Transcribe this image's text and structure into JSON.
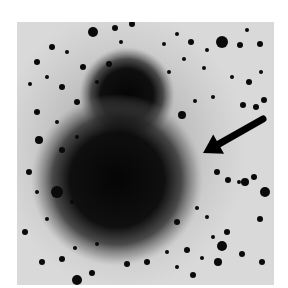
{
  "image": {
    "description": "Negative astronomical photograph of a galaxy with an upper and lower lobe against a star field, with an arrow pointing to a feature at the right edge of the lower lobe",
    "background_color": "#d9d9d9",
    "ink_color": "#0a0a0a"
  },
  "galaxy": {
    "upper_lobe": {
      "cx": 110,
      "cy": 73,
      "r": 48
    },
    "lower_lobe": {
      "cx": 100,
      "cy": 158,
      "r": 86
    }
  },
  "arrow": {
    "tail": [
      246,
      97
    ],
    "head": [
      186,
      131
    ]
  },
  "stars": [
    [
      76,
      10,
      5
    ],
    [
      98,
      6,
      3
    ],
    [
      115,
      2,
      3
    ],
    [
      205,
      20,
      6
    ],
    [
      223,
      23,
      3
    ],
    [
      230,
      8,
      2
    ],
    [
      243,
      22,
      3
    ],
    [
      20,
      40,
      3
    ],
    [
      35,
      25,
      3
    ],
    [
      50,
      30,
      2
    ],
    [
      66,
      45,
      3
    ],
    [
      92,
      42,
      3
    ],
    [
      104,
      20,
      2
    ],
    [
      147,
      22,
      2
    ],
    [
      160,
      12,
      2
    ],
    [
      174,
      20,
      3
    ],
    [
      190,
      28,
      2
    ],
    [
      13,
      62,
      2
    ],
    [
      30,
      55,
      2
    ],
    [
      45,
      65,
      3
    ],
    [
      60,
      80,
      3
    ],
    [
      80,
      60,
      2
    ],
    [
      152,
      50,
      2
    ],
    [
      167,
      37,
      2
    ],
    [
      187,
      46,
      2
    ],
    [
      215,
      55,
      2
    ],
    [
      232,
      60,
      3
    ],
    [
      244,
      50,
      2
    ],
    [
      20,
      90,
      3
    ],
    [
      40,
      100,
      2
    ],
    [
      22,
      118,
      4
    ],
    [
      45,
      128,
      3
    ],
    [
      60,
      115,
      2
    ],
    [
      165,
      93,
      4
    ],
    [
      178,
      79,
      2
    ],
    [
      196,
      75,
      2
    ],
    [
      226,
      83,
      3
    ],
    [
      239,
      85,
      3
    ],
    [
      247,
      78,
      3
    ],
    [
      12,
      150,
      3
    ],
    [
      20,
      170,
      2
    ],
    [
      40,
      170,
      6
    ],
    [
      55,
      180,
      2
    ],
    [
      30,
      197,
      2
    ],
    [
      8,
      210,
      3
    ],
    [
      200,
      150,
      3
    ],
    [
      211,
      158,
      3
    ],
    [
      228,
      160,
      4
    ],
    [
      237,
      155,
      3
    ],
    [
      222,
      160,
      2
    ],
    [
      248,
      170,
      5
    ],
    [
      243,
      197,
      3
    ],
    [
      210,
      210,
      3
    ],
    [
      196,
      215,
      2
    ],
    [
      205,
      224,
      5
    ],
    [
      201,
      240,
      4
    ],
    [
      25,
      240,
      3
    ],
    [
      45,
      237,
      3
    ],
    [
      60,
      258,
      5
    ],
    [
      75,
      251,
      3
    ],
    [
      58,
      226,
      2
    ],
    [
      80,
      222,
      2
    ],
    [
      110,
      242,
      3
    ],
    [
      130,
      240,
      3
    ],
    [
      150,
      230,
      2
    ],
    [
      160,
      245,
      2
    ],
    [
      170,
      228,
      3
    ],
    [
      176,
      253,
      3
    ],
    [
      185,
      236,
      2
    ],
    [
      225,
      232,
      3
    ],
    [
      245,
      240,
      3
    ],
    [
      190,
      195,
      2
    ],
    [
      180,
      186,
      2
    ],
    [
      160,
      200,
      3
    ]
  ]
}
